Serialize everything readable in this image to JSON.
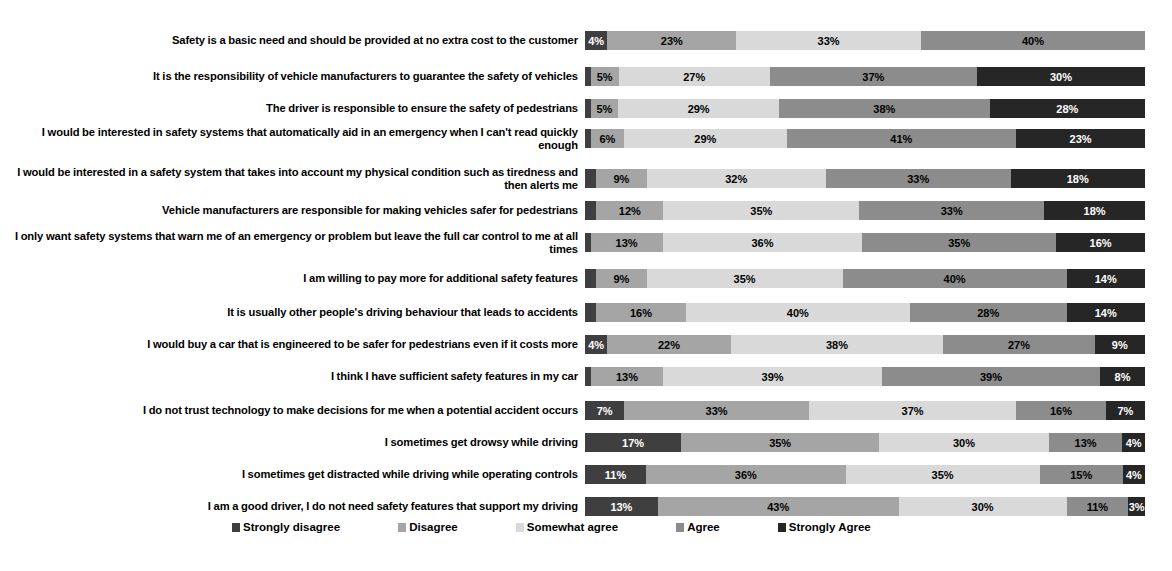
{
  "chart_data": {
    "type": "bar",
    "subtype": "stacked-horizontal-100pct",
    "title": "",
    "xlabel": "",
    "ylabel": "",
    "xlim": [
      0,
      100
    ],
    "grid": false,
    "legend_position": "bottom",
    "value_suffix": "%",
    "series": [
      {
        "name": "Strongly disagree",
        "color": "#3f3f3f"
      },
      {
        "name": "Disagree",
        "color": "#a5a5a5"
      },
      {
        "name": "Somewhat agree",
        "color": "#d9d9d9"
      },
      {
        "name": "Agree",
        "color": "#8c8c8c"
      },
      {
        "name": "Strongly Agree",
        "color": "#262626"
      }
    ],
    "categories": [
      "Safety is a basic need and should be provided at no extra cost to the customer",
      "It is the responsibility of vehicle manufacturers to guarantee the safety of vehicles",
      "The driver is responsible to ensure the safety of pedestrians",
      "I would be interested in safety systems that automatically aid in an emergency when I can't read quickly enough",
      "I would be interested in a safety system that takes into account my physical condition such as tiredness and then alerts me",
      "Vehicle manufacturers are responsible for making vehicles safer for pedestrians",
      "I only want safety systems that warn me of an emergency or problem but leave the full car control to me at all times",
      "I am willing to pay more for additional safety features",
      "It is usually other people's driving behaviour that leads to accidents",
      "I would buy a car that is engineered to be safer for pedestrians even if it costs more",
      "I think I have sufficient safety features in my car",
      "I do not trust technology to make decisions for me when a potential accident occurs",
      "I sometimes get drowsy while driving",
      "I sometimes get distracted while driving while operating controls",
      "I am a good driver, I do not need safety features that support my driving"
    ],
    "rows": [
      {
        "values": [
          4,
          23,
          33,
          40,
          0
        ],
        "labels": [
          "4%",
          "23%",
          "33%",
          "40%",
          ""
        ]
      },
      {
        "values": [
          1,
          5,
          27,
          37,
          30
        ],
        "labels": [
          "",
          "5%",
          "27%",
          "37%",
          "30%"
        ]
      },
      {
        "values": [
          1,
          5,
          29,
          38,
          28
        ],
        "labels": [
          "",
          "5%",
          "29%",
          "38%",
          "28%"
        ]
      },
      {
        "values": [
          1,
          6,
          29,
          41,
          23
        ],
        "labels": [
          "",
          "6%",
          "29%",
          "41%",
          "23%"
        ]
      },
      {
        "values": [
          2,
          9,
          32,
          33,
          24
        ],
        "labels": [
          "",
          "9%",
          "32%",
          "33%",
          "18%"
        ]
      },
      {
        "values": [
          2,
          12,
          35,
          33,
          18
        ],
        "labels": [
          "",
          "12%",
          "35%",
          "33%",
          "18%"
        ]
      },
      {
        "values": [
          1,
          13,
          36,
          35,
          16
        ],
        "labels": [
          "",
          "13%",
          "36%",
          "35%",
          "16%"
        ]
      },
      {
        "values": [
          2,
          9,
          35,
          40,
          14
        ],
        "labels": [
          "",
          "9%",
          "35%",
          "40%",
          "14%"
        ]
      },
      {
        "values": [
          2,
          16,
          40,
          28,
          14
        ],
        "labels": [
          "",
          "16%",
          "40%",
          "28%",
          "14%"
        ]
      },
      {
        "values": [
          4,
          22,
          38,
          27,
          9
        ],
        "labels": [
          "4%",
          "22%",
          "38%",
          "27%",
          "9%"
        ]
      },
      {
        "values": [
          1,
          13,
          39,
          39,
          8
        ],
        "labels": [
          "",
          "13%",
          "39%",
          "39%",
          "8%"
        ]
      },
      {
        "values": [
          7,
          33,
          37,
          16,
          7
        ],
        "labels": [
          "7%",
          "33%",
          "37%",
          "16%",
          "7%"
        ]
      },
      {
        "values": [
          17,
          35,
          30,
          13,
          4
        ],
        "labels": [
          "17%",
          "35%",
          "30%",
          "13%",
          "4%"
        ]
      },
      {
        "values": [
          11,
          36,
          35,
          15,
          4
        ],
        "labels": [
          "11%",
          "36%",
          "35%",
          "15%",
          "4%"
        ]
      },
      {
        "values": [
          13,
          43,
          30,
          11,
          3
        ],
        "labels": [
          "13%",
          "43%",
          "30%",
          "11%",
          "3%"
        ]
      }
    ]
  },
  "legend": {
    "items": [
      {
        "label": "Strongly disagree",
        "color": "#3f3f3f"
      },
      {
        "label": "Disagree",
        "color": "#a5a5a5"
      },
      {
        "label": "Somewhat agree",
        "color": "#d9d9d9"
      },
      {
        "label": "Agree",
        "color": "#8c8c8c"
      },
      {
        "label": "Strongly Agree",
        "color": "#262626"
      }
    ]
  }
}
